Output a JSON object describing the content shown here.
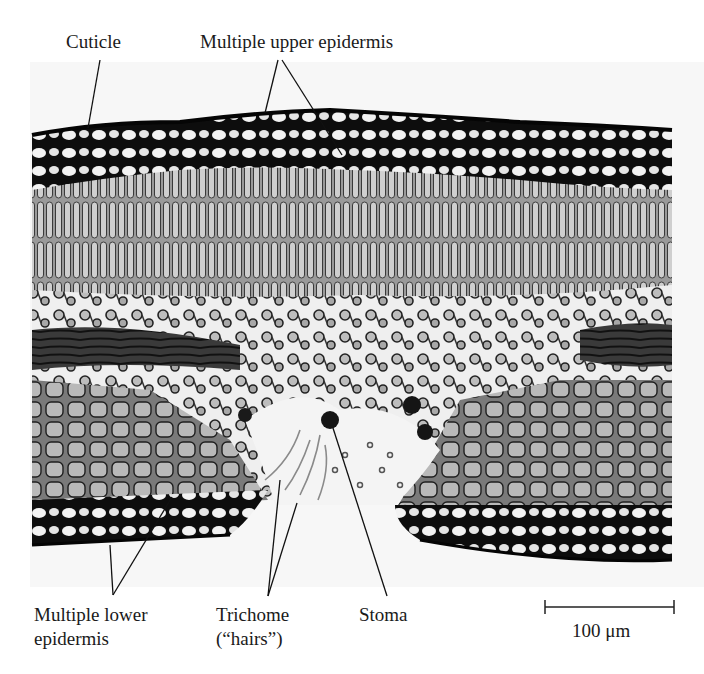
{
  "figure": {
    "type": "micrograph",
    "labels": {
      "cuticle": "Cuticle",
      "upper_epidermis": "Multiple upper epidermis",
      "lower_epidermis_line1": "Multiple lower",
      "lower_epidermis_line2": "epidermis",
      "trichome_line1": "Trichome",
      "trichome_line2": "(“hairs”)",
      "stoma": "Stoma"
    },
    "scale_bar": {
      "label": "100 μm",
      "value": 100,
      "unit": "μm"
    },
    "colors": {
      "background": "#ffffff",
      "tissue_dark": "#111111",
      "tissue_mid": "#6e6e6e",
      "tissue_light": "#d8d8d8",
      "text": "#1a1a1a"
    }
  }
}
